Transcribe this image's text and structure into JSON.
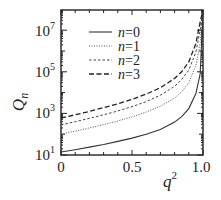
{
  "chart_data": {
    "type": "line",
    "title": "",
    "xlabel": "q^2",
    "ylabel": "Q_n",
    "xscale": "linear",
    "yscale": "log",
    "xlim": [
      0,
      1.0
    ],
    "ylim": [
      10,
      100000000
    ],
    "xticks": [
      0,
      0.5,
      1.0
    ],
    "xtick_labels": [
      "0",
      "0.5",
      "1.0"
    ],
    "yticks": [
      10,
      1000,
      100000,
      10000000
    ],
    "ytick_labels": [
      "10^1",
      "10^3",
      "10^5",
      "10^7"
    ],
    "grid": false,
    "legend_position": "upper center",
    "x": [
      0,
      0.1,
      0.2,
      0.3,
      0.4,
      0.5,
      0.6,
      0.7,
      0.8,
      0.85,
      0.9,
      0.95,
      0.98,
      1.0
    ],
    "series": [
      {
        "name": "n=0",
        "style": "solid",
        "values": [
          14,
          18,
          24,
          32,
          45,
          65,
          100,
          170,
          380,
          700,
          1700,
          9000,
          80000,
          100000000
        ]
      },
      {
        "name": "n=1",
        "style": "dotted",
        "values": [
          100,
          140,
          200,
          290,
          430,
          680,
          1150,
          2200,
          5500,
          11000,
          30000,
          200000,
          2500000,
          100000000
        ]
      },
      {
        "name": "n=2",
        "style": "dashed-short",
        "values": [
          280,
          400,
          580,
          860,
          1300,
          2100,
          3700,
          7500,
          20000,
          42000,
          120000,
          900000,
          10000000,
          100000000
        ]
      },
      {
        "name": "n=3",
        "style": "dashed-long",
        "values": [
          600,
          860,
          1250,
          1900,
          2900,
          4700,
          8500,
          17000,
          48000,
          100000,
          300000,
          2300000,
          25000000,
          100000000
        ]
      }
    ]
  },
  "labels": {
    "x_title_base": "q",
    "x_title_sup": "2",
    "y_title_base": "Q",
    "y_title_sub": "n",
    "xticks": [
      "0",
      "0.5",
      "1.0"
    ],
    "yticks": [
      {
        "base": "10",
        "exp": "7"
      },
      {
        "base": "10",
        "exp": "5"
      },
      {
        "base": "10",
        "exp": "3"
      },
      {
        "base": "10",
        "exp": "1"
      }
    ]
  },
  "legend": [
    {
      "label_var": "n",
      "label_eq": "=0"
    },
    {
      "label_var": "n",
      "label_eq": "=1"
    },
    {
      "label_var": "n",
      "label_eq": "=2"
    },
    {
      "label_var": "n",
      "label_eq": "=3"
    }
  ]
}
